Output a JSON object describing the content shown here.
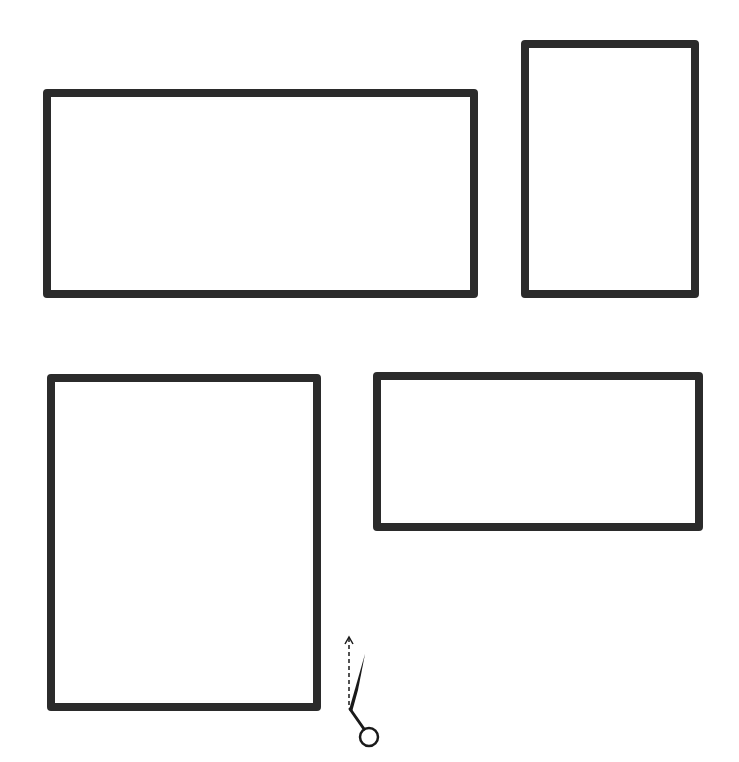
{
  "diagram": {
    "stroke_color": "#2b2b2b",
    "background_color": "#ffffff",
    "frames": [
      {
        "id": "frame-1",
        "orientation": "landscape",
        "x": 43,
        "y": 89,
        "width": 435,
        "height": 209
      },
      {
        "id": "frame-2",
        "orientation": "portrait",
        "x": 521,
        "y": 40,
        "width": 178,
        "height": 258
      },
      {
        "id": "frame-3",
        "orientation": "portrait",
        "x": 47,
        "y": 374,
        "width": 274,
        "height": 337
      },
      {
        "id": "frame-4",
        "orientation": "landscape",
        "x": 373,
        "y": 372,
        "width": 330,
        "height": 159
      }
    ],
    "icons": [
      {
        "name": "scissors-icon",
        "meaning": "cut line indicator with upward arrow"
      }
    ]
  }
}
